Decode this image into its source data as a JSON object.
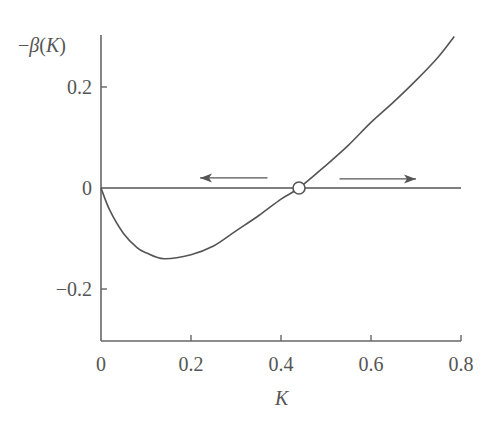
{
  "chart_data": {
    "type": "line",
    "title": "",
    "xlabel": "K",
    "ylabel": "−β(K)",
    "ylabel_parts": {
      "minus": "−",
      "beta": "β",
      "open": "(",
      "var": "K",
      "close": ")"
    },
    "xlim": [
      0,
      0.8
    ],
    "ylim": [
      -0.3,
      0.3
    ],
    "x_ticks": [
      0,
      0.2,
      0.4,
      0.6,
      0.8
    ],
    "x_tick_labels": [
      "0",
      "0.2",
      "0.4",
      "0.6",
      "0.8"
    ],
    "y_ticks": [
      -0.2,
      0,
      0.2
    ],
    "y_tick_labels": [
      "−0.2",
      "0",
      "0.2"
    ],
    "grid": false,
    "legend": null,
    "series": [
      {
        "name": "-beta(K)",
        "x": [
          0,
          0.02,
          0.05,
          0.08,
          0.1,
          0.14,
          0.2,
          0.25,
          0.3,
          0.35,
          0.4,
          0.44,
          0.5,
          0.55,
          0.6,
          0.65,
          0.7,
          0.75,
          0.785
        ],
        "y": [
          0,
          -0.045,
          -0.09,
          -0.118,
          -0.128,
          -0.14,
          -0.132,
          -0.115,
          -0.085,
          -0.055,
          -0.022,
          0,
          0.045,
          0.085,
          0.13,
          0.17,
          0.213,
          0.26,
          0.3
        ]
      },
      {
        "name": "zero-line",
        "x": [
          0,
          0.8
        ],
        "y": [
          0,
          0
        ]
      }
    ],
    "annotations": [
      {
        "type": "open-circle",
        "label": "fixed point K*",
        "x": 0.44,
        "y": 0
      },
      {
        "type": "arrow",
        "direction": "left",
        "x_from": 0.37,
        "x_to": 0.22,
        "y": 0.02
      },
      {
        "type": "arrow",
        "direction": "right",
        "x_from": 0.53,
        "x_to": 0.7,
        "y": 0.018
      }
    ]
  },
  "style": {
    "line_color": "#555555",
    "axis_color": "#666666",
    "background": "#ffffff"
  }
}
